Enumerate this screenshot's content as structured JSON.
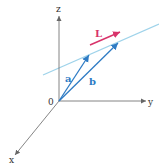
{
  "diagram": {
    "type": "3d-vector-line",
    "axes": {
      "z_label": "z",
      "y_label": "y",
      "x_label": "x",
      "origin_label": "0"
    },
    "vectors": [
      {
        "name": "a",
        "label": "a",
        "color": "#2e7bc4"
      },
      {
        "name": "b",
        "label": "b",
        "color": "#2e7bc4"
      }
    ],
    "line": {
      "name": "L",
      "color": "#9fd3ea"
    },
    "direction": {
      "label": "L",
      "color": "#d8336a"
    },
    "colors": {
      "axis": "#666666",
      "vector": "#2e7bc4",
      "line": "#9fd3ea",
      "direction": "#d8336a",
      "background": "#ffffff"
    }
  }
}
